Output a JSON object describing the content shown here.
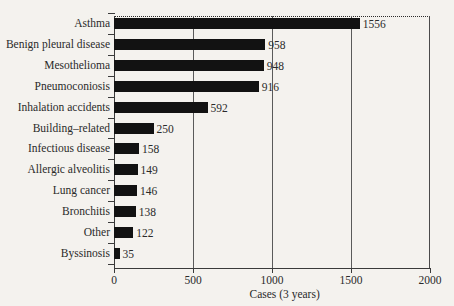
{
  "chart_data": {
    "type": "bar",
    "orientation": "horizontal",
    "title": "",
    "xlabel": "Cases (3 years)",
    "ylabel": "",
    "xlim": [
      0,
      2000
    ],
    "xticks": [
      0,
      500,
      1000,
      1500,
      2000
    ],
    "xtick_labels": [
      "0",
      "500",
      "1000",
      "1500",
      "2000"
    ],
    "grid": "vertical",
    "legend": "none",
    "categories": [
      "Asthma",
      "Benign pleural disease",
      "Mesothelioma",
      "Pneumoconiosis",
      "Inhalation accidents",
      "Building–related",
      "Infectious disease",
      "Allergic alveolitis",
      "Lung cancer",
      "Bronchitis",
      "Other",
      "Byssinosis"
    ],
    "values": [
      1556,
      958,
      948,
      916,
      592,
      250,
      158,
      149,
      146,
      138,
      122,
      35
    ],
    "value_labels": [
      "1556",
      "958",
      "948",
      "916",
      "592",
      "250",
      "158",
      "149",
      "146",
      "138",
      "122",
      "35"
    ],
    "bar_color": "#121212",
    "text_color": "#2a2a2a",
    "background_color": "#f4f2ee"
  }
}
